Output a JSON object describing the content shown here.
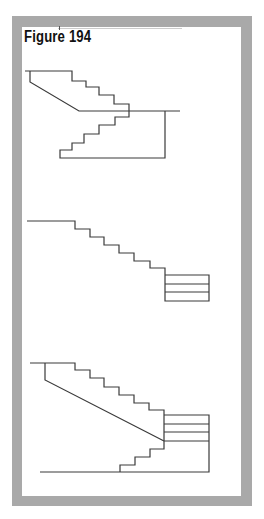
{
  "figure": {
    "title": "Figure 194",
    "frame_color": "#a9a9a9",
    "line_color": "#3a3a3a"
  },
  "diagrams": [
    {
      "name": "split-stair-section",
      "description": "upper flight descending to landing, lower flight below landing"
    },
    {
      "name": "straight-stair-with-landing-block",
      "description": "single flight of six steps ending at a stacked block"
    },
    {
      "name": "combined-stair-section",
      "description": "upper flight with soffit to stacked block, lower flight below"
    }
  ]
}
